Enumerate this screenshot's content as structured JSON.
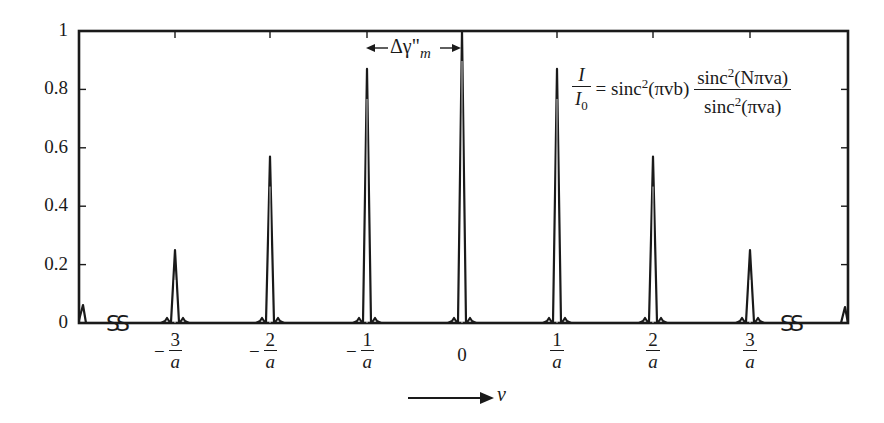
{
  "chart_data": {
    "type": "line",
    "title": "",
    "xlabel": "ν",
    "ylabel": "I / I0",
    "ylim": [
      0,
      1
    ],
    "grid": false,
    "y_ticks": [
      "0",
      "0.2",
      "0.4",
      "0.6",
      "0.8",
      "1"
    ],
    "x_ticks": [
      {
        "sign": "−",
        "num": "3",
        "den": "a"
      },
      {
        "sign": "−",
        "num": "2",
        "den": "a"
      },
      {
        "sign": "−",
        "num": "1",
        "den": "a"
      },
      {
        "sign": "",
        "num": "0",
        "den": ""
      },
      {
        "sign": "",
        "num": "1",
        "den": "a"
      },
      {
        "sign": "",
        "num": "2",
        "den": "a"
      },
      {
        "sign": "",
        "num": "3",
        "den": "a"
      }
    ],
    "x": [
      -3,
      -2,
      -1,
      0,
      1,
      2,
      3
    ],
    "x_units": "1/a",
    "series": [
      {
        "name": "principal maxima (I/I0)",
        "values": [
          0.25,
          0.57,
          0.87,
          1.0,
          0.87,
          0.57,
          0.25
        ]
      }
    ],
    "annotations": {
      "formula": "I/I0 = sinc²(πνb) · sinc²(Nπνa) / sinc²(πνa)",
      "peak_width_label": "Δγ\"m",
      "axis_break_symbols": [
        "SS",
        "SS"
      ],
      "axis_arrow_label": "ν"
    }
  },
  "labels": {
    "y": [
      "1",
      "0.8",
      "0.6",
      "0.4",
      "0.2",
      "0"
    ],
    "delta": "Δγ\"",
    "delta_sub": "m",
    "nu": "v",
    "formula": {
      "lhs_num": "I",
      "lhs_den": "I",
      "lhs_den_sub": "0",
      "eq": "= sinc",
      "sq": "2",
      "arg1": "(πvb)",
      "rhs_num_pre": "sinc",
      "rhs_num_arg": "(Nπva)",
      "rhs_den_pre": "sinc",
      "rhs_den_arg": "(πva)"
    },
    "ticks": {
      "m3": {
        "sign": "−",
        "num": "3",
        "den": "a"
      },
      "m2": {
        "sign": "−",
        "num": "2",
        "den": "a"
      },
      "m1": {
        "sign": "−",
        "num": "1",
        "den": "a"
      },
      "z": "0",
      "p1": {
        "num": "1",
        "den": "a"
      },
      "p2": {
        "num": "2",
        "den": "a"
      },
      "p3": {
        "num": "3",
        "den": "a"
      }
    }
  }
}
